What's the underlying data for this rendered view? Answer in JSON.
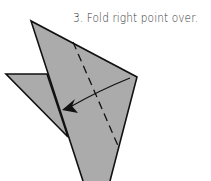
{
  "step": {
    "number": "3.",
    "instruction": "Fold right point over.",
    "caption": "3. Fold right point over."
  },
  "colors": {
    "paper_fill": "#ababab",
    "outline": "#111111",
    "background": "#ffffff",
    "text": "#333333"
  },
  "diagram": {
    "shapes": [
      {
        "name": "left-flap",
        "points": "6,74 47,74 68,137"
      },
      {
        "name": "main-body",
        "points": "31,21 137,77 110,181 83,181"
      }
    ],
    "fold_line": {
      "type": "valley-fold-dashed",
      "from": [
        73,
        42
      ],
      "to": [
        119,
        148
      ]
    },
    "arrow": {
      "from": [
        130,
        78
      ],
      "control": [
        100,
        90
      ],
      "to": [
        68,
        108
      ],
      "head": [
        63,
        110
      ]
    }
  }
}
